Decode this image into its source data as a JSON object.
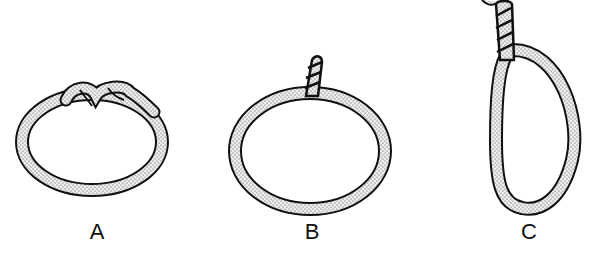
{
  "figure": {
    "type": "knot-diagram",
    "panels": [
      {
        "id": "A",
        "label": "A",
        "description": "rope loop closed with a square-style knot at top"
      },
      {
        "id": "B",
        "label": "B",
        "description": "rope loop with twisted standing end rising from top"
      },
      {
        "id": "C",
        "label": "C",
        "description": "elongated rope loop hanging from twisted standing end"
      }
    ]
  },
  "colors": {
    "outline": "#111111",
    "rope_fill": "#e8e8e8",
    "stipple": "#555555",
    "background": "#ffffff"
  }
}
